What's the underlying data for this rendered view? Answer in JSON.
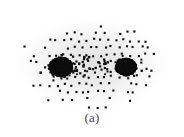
{
  "figure": {
    "caption": "(a)",
    "background_color": "#ffffff",
    "dot_color": "#0d0d0d",
    "halo_color": "#d9d9d9",
    "caption_color": "#4a4a4a"
  },
  "chart_data": {
    "type": "scatter",
    "title": "",
    "subtitle": "",
    "xlabel": "",
    "ylabel": "",
    "annotations": [
      "(a)"
    ],
    "legend": [],
    "legend_position": "none",
    "grid": false,
    "axis_visible": false,
    "tick_labels_x": [],
    "tick_labels_y": [],
    "xlim": [
      0,
      184
    ],
    "ylim": [
      0,
      110
    ],
    "point_marker": "square",
    "point_size_px": 2.1,
    "lattice_spacing_px": 7.4,
    "jitter_px": 1.6,
    "envelope": {
      "shape": "ellipse",
      "center_x": 92,
      "center_y": 65,
      "radius_x": 80,
      "radius_y": 47,
      "falloff_exponent": 2.2
    },
    "halo": {
      "center_x": 92,
      "center_y": 64,
      "radius_x": 80,
      "radius_y": 48,
      "peak_alpha": 0.26
    },
    "ridge": {
      "x_start": 62,
      "x_end": 126,
      "y": 67,
      "half_width_px": 5.0,
      "strength": 1.45
    },
    "foci": [
      {
        "name": "left-core",
        "x": 61,
        "y": 67,
        "sigma_x": 7.5,
        "sigma_y": 6.0,
        "strength": 7.0
      },
      {
        "name": "right-core",
        "x": 126,
        "y": 67,
        "sigma_x": 6.5,
        "sigma_y": 5.5,
        "strength": 6.2
      }
    ],
    "series": [
      {
        "name": "density-field",
        "n_points_approx": 640,
        "x_range": [
          16,
          170
        ],
        "y_range": [
          18,
          106
        ]
      }
    ]
  }
}
